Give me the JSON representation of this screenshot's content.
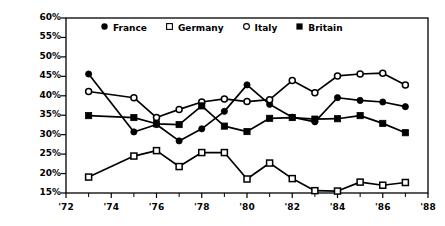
{
  "chart_data": {
    "type": "line",
    "title": "",
    "xlabel": "",
    "ylabel": "% never talking about politics",
    "xlim": [
      1972,
      1988
    ],
    "ylim": [
      15,
      60
    ],
    "grid": false,
    "legend_position": "top-center",
    "x_tick_labels": [
      "'72",
      "'74",
      "'76",
      "'78",
      "'80",
      "'82",
      "'84",
      "'86",
      "'88"
    ],
    "x_tick_values": [
      1972,
      1974,
      1976,
      1978,
      1980,
      1982,
      1984,
      1986,
      1988
    ],
    "x_minor_ticks": [
      1973,
      1975,
      1977,
      1979,
      1981,
      1983,
      1985,
      1987
    ],
    "y_tick_labels": [
      "60%",
      "55%",
      "50%",
      "45%",
      "40%",
      "35%",
      "30%",
      "25%",
      "20%",
      "15%"
    ],
    "y_tick_values": [
      60,
      55,
      50,
      45,
      40,
      35,
      30,
      25,
      20,
      15
    ],
    "x": [
      1973,
      1975,
      1976,
      1977,
      1978,
      1979,
      1980,
      1981,
      1982,
      1983,
      1984,
      1985,
      1986,
      1987
    ],
    "series": [
      {
        "name": "France",
        "marker": "filled-circle",
        "color": "#000000",
        "values": [
          45.6,
          30.7,
          32.6,
          28.4,
          31.5,
          36.0,
          42.8,
          37.8,
          34.5,
          33.3,
          39.5,
          38.8,
          38.4,
          37.2
        ]
      },
      {
        "name": "Germany",
        "marker": "open-square",
        "color": "#000000",
        "values": [
          19.1,
          24.5,
          25.9,
          21.8,
          25.4,
          25.4,
          18.6,
          22.7,
          18.7,
          15.6,
          15.5,
          17.8,
          17.0,
          17.7
        ]
      },
      {
        "name": "Italy",
        "marker": "open-circle",
        "color": "#000000",
        "values": [
          41.1,
          39.5,
          34.4,
          36.5,
          38.4,
          39.2,
          38.5,
          39.0,
          43.9,
          40.8,
          45.1,
          45.6,
          45.8,
          42.8
        ]
      },
      {
        "name": "Britain",
        "marker": "filled-square",
        "color": "#000000",
        "values": [
          34.9,
          34.4,
          32.8,
          32.6,
          37.4,
          32.2,
          30.8,
          34.2,
          34.4,
          34.0,
          34.1,
          34.9,
          32.9,
          30.5
        ]
      }
    ]
  },
  "legend": {
    "items": [
      {
        "label": "France",
        "marker": "filled-circle"
      },
      {
        "label": "Germany",
        "marker": "open-square"
      },
      {
        "label": "Italy",
        "marker": "open-circle"
      },
      {
        "label": "Britain",
        "marker": "filled-square"
      }
    ]
  }
}
